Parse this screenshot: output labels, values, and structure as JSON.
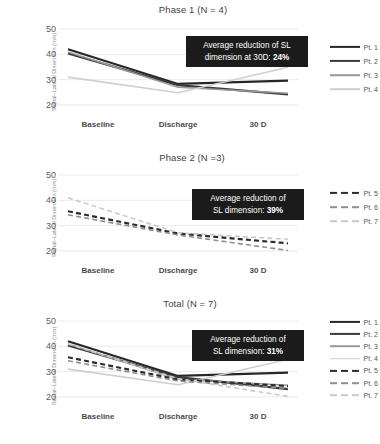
{
  "axis": {
    "ylabel": "Septal–Lateral Dimension (mm)",
    "yticks": [
      50,
      40,
      30,
      20
    ],
    "xticks": [
      "Baseline",
      "Discharge",
      "30 D"
    ]
  },
  "panels": [
    {
      "title": "Phase 1 (N = 4)",
      "callout_line1": "Average reduction of SL",
      "callout_line2_pre": "dimension at 30D: ",
      "callout_line2_value": "24%",
      "legend": [
        "Pt. 1",
        "Pt. 2",
        "Pt. 3",
        "Pt. 4"
      ]
    },
    {
      "title": "Phase 2 (N =3)",
      "callout_line1": "Average reduction of",
      "callout_line2_pre": "SL dimension: ",
      "callout_line2_value": "39%",
      "legend": [
        "Pt. 5",
        "Pt. 6",
        "Pt. 7"
      ]
    },
    {
      "title": "Total (N = 7)",
      "callout_line1": "Average reduction of",
      "callout_line2_pre": "SL dimension: ",
      "callout_line2_value": "31%",
      "legend": [
        "Pt. 1",
        "Pt. 2",
        "Pt. 3",
        "Pt. 4",
        "Pt. 5",
        "Pt. 6",
        "Pt. 7"
      ]
    }
  ],
  "chart_data": [
    {
      "type": "line",
      "title": "Phase 1 (N = 4)",
      "xlabel": "",
      "ylabel": "Septal–Lateral Dimension (mm)",
      "categories": [
        "Baseline",
        "Discharge",
        "30 D"
      ],
      "ylim": [
        18,
        52
      ],
      "yticks": [
        20,
        30,
        40,
        50
      ],
      "grid": true,
      "legend_position": "right",
      "annotation": "Average reduction of SL dimension at 30D: 24%",
      "series": [
        {
          "name": "Pt. 1",
          "values": [
            42.0,
            28.3,
            29.6
          ],
          "color": "#262626",
          "width": 2.2,
          "dash": "none"
        },
        {
          "name": "Pt. 2",
          "values": [
            40.4,
            27.8,
            24.2
          ],
          "color": "#3a3a3a",
          "width": 2.2,
          "dash": "none"
        },
        {
          "name": "Pt. 3",
          "values": [
            40.9,
            27.0,
            24.6
          ],
          "color": "#9a9a9a",
          "width": 1.6,
          "dash": "none"
        },
        {
          "name": "Pt. 4",
          "values": [
            31.0,
            24.8,
            34.9
          ],
          "color": "#cfcfcf",
          "width": 1.6,
          "dash": "none"
        }
      ]
    },
    {
      "type": "line",
      "title": "Phase 2 (N =3)",
      "xlabel": "",
      "ylabel": "Septal–Lateral Dimension (mm)",
      "categories": [
        "Baseline",
        "Discharge",
        "30 D"
      ],
      "ylim": [
        18,
        52
      ],
      "yticks": [
        20,
        30,
        40,
        50
      ],
      "grid": true,
      "legend_position": "right",
      "annotation": "Average reduction of SL dimension: 39%",
      "series": [
        {
          "name": "Pt. 5",
          "values": [
            35.7,
            26.9,
            23.0
          ],
          "color": "#2b2b2b",
          "width": 2.2,
          "dash": "dashed"
        },
        {
          "name": "Pt. 6",
          "values": [
            34.3,
            26.3,
            20.2
          ],
          "color": "#8f8f8f",
          "width": 1.6,
          "dash": "dashed"
        },
        {
          "name": "Pt. 7",
          "values": [
            41.0,
            27.2,
            24.6
          ],
          "color": "#cacaca",
          "width": 1.6,
          "dash": "dashed"
        }
      ]
    },
    {
      "type": "line",
      "title": "Total (N = 7)",
      "xlabel": "",
      "ylabel": "Septal–Lateral Dimension (mm)",
      "categories": [
        "Baseline",
        "Discharge",
        "30 D"
      ],
      "ylim": [
        18,
        52
      ],
      "yticks": [
        20,
        30,
        40,
        50
      ],
      "grid": true,
      "legend_position": "right",
      "annotation": "Average reduction of SL dimension: 31%",
      "series": [
        {
          "name": "Pt. 1",
          "values": [
            42.0,
            28.3,
            29.6
          ],
          "color": "#262626",
          "width": 2.2,
          "dash": "none"
        },
        {
          "name": "Pt. 2",
          "values": [
            40.4,
            27.8,
            23.1
          ],
          "color": "#3a3a3a",
          "width": 2.2,
          "dash": "none"
        },
        {
          "name": "Pt. 3",
          "values": [
            40.9,
            27.0,
            24.6
          ],
          "color": "#9a9a9a",
          "width": 1.6,
          "dash": "none"
        },
        {
          "name": "Pt. 4",
          "values": [
            31.0,
            24.8,
            34.9
          ],
          "color": "#cfcfcf",
          "width": 1.6,
          "dash": "none"
        },
        {
          "name": "Pt. 5",
          "values": [
            35.7,
            26.9,
            24.3
          ],
          "color": "#2b2b2b",
          "width": 2.2,
          "dash": "dashed"
        },
        {
          "name": "Pt. 6",
          "values": [
            34.3,
            26.3,
            23.4
          ],
          "color": "#8f8f8f",
          "width": 1.6,
          "dash": "dashed"
        },
        {
          "name": "Pt. 7",
          "values": [
            41.0,
            27.2,
            20.2
          ],
          "color": "#cacaca",
          "width": 1.6,
          "dash": "dashed"
        }
      ]
    }
  ]
}
